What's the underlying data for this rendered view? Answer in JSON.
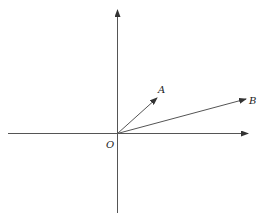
{
  "diagram": {
    "type": "vector-diagram",
    "origin_label": "O",
    "vectors": [
      {
        "label": "A",
        "from": "O",
        "direction": "upper-right, ~55° from x-axis"
      },
      {
        "label": "B",
        "from": "O",
        "direction": "right, ~17° from x-axis"
      }
    ],
    "axes": [
      "x-axis",
      "y-axis"
    ]
  },
  "labels": {
    "origin": "O",
    "vector_a": "A",
    "vector_b": "B"
  },
  "colors": {
    "line": "#555555",
    "text": "#222222",
    "background": "#ffffff"
  }
}
